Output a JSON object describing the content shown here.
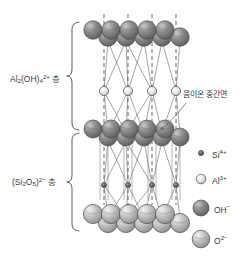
{
  "figure": {
    "background": "#ffffff",
    "line_color": "#4a4a4a"
  },
  "layer_labels": [
    {
      "id": "al-hydroxide-layer",
      "formula_html": "Al<sub>2</sub>(OH)<sub>4</sub><sup>2+</sup>",
      "base": "Al",
      "sub1": "2",
      "mid": "(OH)",
      "sub2": "4",
      "charge": "2+",
      "suffix": "µµ",
      "suffix_text": "쿡",
      "layer_word": "층",
      "x": 10,
      "y": 74
    },
    {
      "id": "silicate-layer",
      "base": "(Si",
      "sub1": "2",
      "mid": "O",
      "sub2": "5",
      "tail": ")",
      "charge": "2−",
      "layer_word": "층",
      "x": 12,
      "y": 177
    }
  ],
  "annotation": {
    "id": "anion-interlayer-plane",
    "text": "음이온 중간면",
    "x": 183,
    "y": 89
  },
  "legend": [
    {
      "id": "si-ion",
      "symbol": "Si",
      "charge": "4+",
      "radius": 2.6,
      "fill": "#6e6e6e",
      "cx": 201,
      "cy": 153,
      "tx": 212,
      "ty": 149
    },
    {
      "id": "al-ion",
      "symbol": "Al",
      "charge": "3+",
      "radius": 4.8,
      "fill": "#e2e2e2",
      "cx": 201,
      "cy": 179,
      "tx": 212,
      "ty": 175
    },
    {
      "id": "oh-ion",
      "symbol": "OH",
      "charge": "−",
      "radius": 8.0,
      "fill": "#8a8a8a",
      "cx": 201,
      "cy": 208,
      "tx": 214,
      "ty": 204
    },
    {
      "id": "o-ion",
      "symbol": "O",
      "charge": "2−",
      "radius": 8.8,
      "fill": "#bcbcbc",
      "cx": 201,
      "cy": 239,
      "tx": 214,
      "ty": 235
    }
  ],
  "braces": [
    {
      "id": "brace-upper",
      "x": 72,
      "top": 22,
      "bottom": 130
    },
    {
      "id": "brace-lower",
      "x": 72,
      "top": 133,
      "bottom": 231
    }
  ],
  "dashed_verticals": [
    {
      "id": "dash-1",
      "x": 104,
      "y1": 14,
      "y2": 205
    },
    {
      "id": "dash-2",
      "x": 128,
      "y1": 14,
      "y2": 205
    },
    {
      "id": "dash-3",
      "x": 152,
      "y1": 14,
      "y2": 205
    },
    {
      "id": "dash-4",
      "x": 176,
      "y1": 14,
      "y2": 205
    }
  ],
  "sphere_layers": [
    {
      "id": "top-hydroxyl-layer",
      "species": "OH−",
      "fill": "#8a8a8a",
      "r": 9.2,
      "rows": [
        {
          "y": 37,
          "xs": [
            100,
            118,
            136,
            154,
            172
          ],
          "dx": 8
        },
        {
          "y": 30,
          "xs": [
            93,
            111,
            129,
            147,
            165
          ],
          "dx": 0
        }
      ]
    },
    {
      "id": "aluminium-plane",
      "species": "Al3+",
      "fill": "#e6e6e6",
      "r": 4.6,
      "rows": [
        {
          "y": 91,
          "xs": [
            104,
            128,
            152,
            176
          ],
          "dx": 0
        }
      ]
    },
    {
      "id": "shared-anion-plane",
      "species": "OH− / O2−",
      "fill": "#8a8a8a",
      "r": 9.0,
      "rows": [
        {
          "y": 137,
          "xs": [
            100,
            118,
            136,
            154,
            172
          ],
          "dx": 8
        },
        {
          "y": 129,
          "xs": [
            93,
            111,
            129,
            147,
            165
          ],
          "dx": 0
        }
      ]
    },
    {
      "id": "silicon-plane",
      "species": "Si4+",
      "fill": "#5a5a5a",
      "r": 2.6,
      "rows": [
        {
          "y": 185,
          "xs": [
            104,
            128,
            152,
            176
          ],
          "dx": 0
        }
      ]
    },
    {
      "id": "bottom-oxygen-layer",
      "species": "O2−",
      "fill": "#bcbcbc",
      "r": 9.6,
      "rows": [
        {
          "y": 223,
          "xs": [
            100,
            118,
            136,
            154,
            172
          ],
          "dx": 8
        },
        {
          "y": 214,
          "xs": [
            93,
            111,
            129,
            147,
            165
          ],
          "dx": 0
        }
      ]
    }
  ]
}
